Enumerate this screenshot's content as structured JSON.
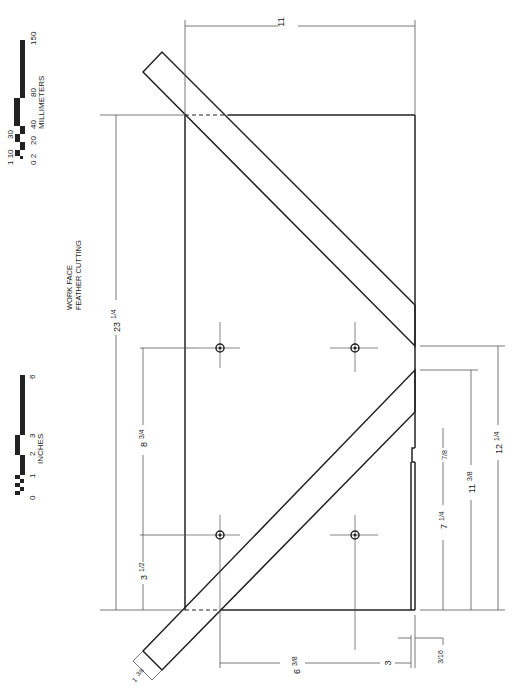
{
  "label": {
    "line1": "WORK FACE",
    "line2": "FEATHER CUTTING"
  },
  "scales": {
    "millimeters": {
      "unit_label": "MILLIMETERS",
      "ticks": [
        "0",
        "2",
        "1",
        "10",
        "20",
        "30",
        "40",
        "80",
        "150"
      ]
    },
    "inches": {
      "unit_label": "INCHES",
      "ticks": [
        "0",
        "1",
        "2",
        "3",
        "6"
      ]
    }
  },
  "dimensions": {
    "overall_length": "23 1/4",
    "overall_width": "11",
    "hole_spacing_long": "8 3/4",
    "hole_offset_end": "3 1/2",
    "hole_spacing_cross": "6 3/8",
    "hole_offset_edge": "3",
    "guide_width": "1 3/8",
    "lip": "3/16",
    "notch_width": "7/8",
    "notch_offset": "7 1/4",
    "guide_inner": "11 3/8",
    "guide_outer": "12 1/4"
  },
  "dim_text": {
    "d23": "23",
    "d23f": "1/4",
    "d11": "11",
    "d8": "8",
    "d8f": "3/4",
    "d3a": "3",
    "d3af": "1/2",
    "d6": "6",
    "d6f": "3/8",
    "d3": "3",
    "d1": "1",
    "d1f": "3/8",
    "d316": "3/16",
    "d78": "7/8",
    "d7": "7",
    "d7f": "1/4",
    "d11b": "11",
    "d11bf": "3/8",
    "d12": "12",
    "d12f": "1/4"
  },
  "colors": {
    "line": "#222222",
    "dim_line": "#555555",
    "background": "#ffffff"
  }
}
